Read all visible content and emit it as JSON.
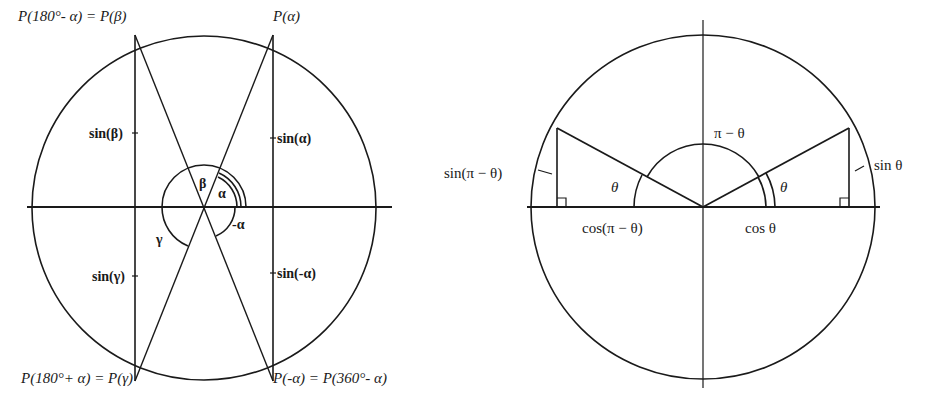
{
  "left_diagram": {
    "title": "Unit circle with symmetric points",
    "points": {
      "top_left": "P(180°- α) = P(β)",
      "top_right": "P(α)",
      "bottom_left": "P(180°+ α) = P(γ)",
      "bottom_right": "P(-α) = P(360°- α)"
    },
    "sine_labels": {
      "beta": "sin(β)",
      "alpha": "sin(α)",
      "gamma": "sin(γ)",
      "neg_alpha": "sin(-α)"
    },
    "angle_labels": {
      "alpha": "α",
      "beta": "β",
      "gamma": "γ",
      "neg_alpha": "-α"
    }
  },
  "right_diagram": {
    "title": "Supplementary angle on unit circle",
    "labels": {
      "pi_minus_theta": "π − θ",
      "theta_left": "θ",
      "theta_right": "θ",
      "sin_pi_minus_theta": "sin(π − θ)",
      "sin_theta": "sin θ",
      "cos_pi_minus_theta": "cos(π − θ)",
      "cos_theta": "cos θ"
    }
  }
}
